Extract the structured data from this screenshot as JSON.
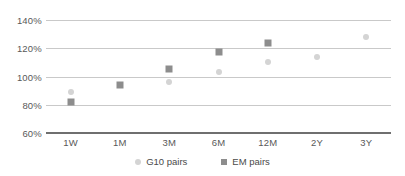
{
  "chart_data": {
    "type": "scatter",
    "title": "",
    "xlabel": "",
    "ylabel": "",
    "categories": [
      "1W",
      "1M",
      "3M",
      "6M",
      "12M",
      "2Y",
      "3Y"
    ],
    "ylim": [
      60,
      140
    ],
    "yticks": [
      60,
      80,
      100,
      120,
      140
    ],
    "ytick_labels": [
      "60%",
      "80%",
      "100%",
      "120%",
      "140%"
    ],
    "grid": true,
    "legend_position": "bottom",
    "series": [
      {
        "name": "G10 pairs",
        "marker": "circle",
        "color": "#d4d4d4",
        "values": [
          89,
          null,
          96,
          103,
          110,
          114,
          128
        ]
      },
      {
        "name": "EM pairs",
        "marker": "square",
        "color": "#8d8d8d",
        "values": [
          82,
          94,
          105,
          117,
          124,
          null,
          null
        ]
      }
    ]
  },
  "legend": {
    "items": [
      {
        "label": "G10 pairs",
        "marker": "circle-marker"
      },
      {
        "label": "EM pairs",
        "marker": "square-marker"
      }
    ]
  }
}
